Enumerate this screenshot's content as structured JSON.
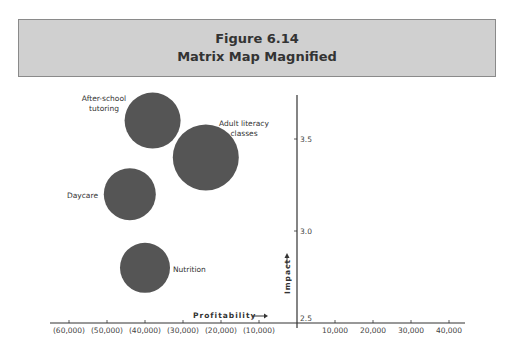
{
  "header": {
    "figure_number": "Figure 6.14",
    "title": "Matrix Map Magnified"
  },
  "chart_data": {
    "type": "scatter",
    "subtype": "bubble",
    "title": "Figure 6.14 Matrix Map Magnified",
    "xlabel": "Profitability",
    "ylabel": "Impact",
    "xlim": [
      -62000,
      42000
    ],
    "ylim": [
      2.5,
      3.75
    ],
    "x_ticks": [
      -60000,
      -50000,
      -40000,
      -30000,
      -20000,
      -10000,
      10000,
      20000,
      30000,
      40000
    ],
    "x_tick_labels": [
      "(60,000)",
      "(50,000)",
      "(40,000)",
      "(30,000)",
      "(20,000)",
      "(10,000)",
      "10,000",
      "20,000",
      "30,000",
      "40,000"
    ],
    "y_ticks": [
      2.5,
      3.0,
      3.5
    ],
    "y_tick_labels": [
      "2.5",
      "3.0",
      "3.5"
    ],
    "grid": false,
    "legend": null,
    "bubble_color": "#555555",
    "points": [
      {
        "label": "After-school tutoring",
        "label_lines": [
          "After-school",
          "tutoring"
        ],
        "x": -38000,
        "y": 3.6,
        "size": 28
      },
      {
        "label": "Adult literacy classes",
        "label_lines": [
          "Adult literacy",
          "classes"
        ],
        "x": -24000,
        "y": 3.4,
        "size": 33
      },
      {
        "label": "Daycare",
        "label_lines": [
          "Daycare"
        ],
        "x": -44000,
        "y": 3.2,
        "size": 26
      },
      {
        "label": "Nutrition",
        "label_lines": [
          "Nutrition"
        ],
        "x": -40000,
        "y": 2.8,
        "size": 25
      }
    ]
  }
}
